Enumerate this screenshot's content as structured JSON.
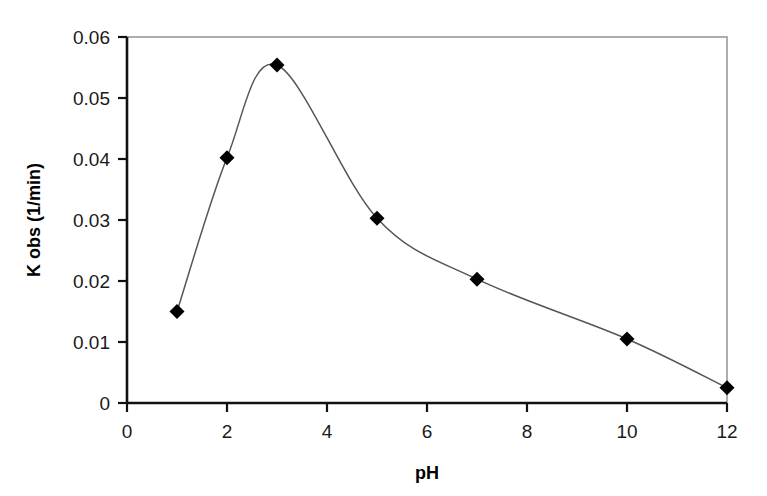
{
  "chart_data": {
    "type": "line",
    "title": "",
    "subtitle": "",
    "xlabel": "pH",
    "ylabel": "K obs (1/min)",
    "xlim": [
      0,
      12
    ],
    "ylim": [
      0,
      0.06
    ],
    "grid": false,
    "legend": null,
    "marker": "filled-diamond",
    "line_color": "#555555",
    "marker_color": "#000000",
    "frame_color": "#999999",
    "axis_color": "#000000",
    "x": [
      1,
      2,
      3,
      5,
      7,
      10,
      12
    ],
    "values": [
      0.015,
      0.0402,
      0.0554,
      0.0303,
      0.0203,
      0.0105,
      0.0025
    ],
    "series": [
      {
        "name": "K obs",
        "x": [
          1,
          2,
          3,
          5,
          7,
          10,
          12
        ],
        "values": [
          0.015,
          0.0402,
          0.0554,
          0.0303,
          0.0203,
          0.0105,
          0.0025
        ]
      }
    ],
    "x_ticks": [
      0,
      2,
      4,
      6,
      8,
      10,
      12
    ],
    "x_tick_labels": [
      "0",
      "2",
      "4",
      "6",
      "8",
      "10",
      "12"
    ],
    "y_ticks": [
      0,
      0.01,
      0.02,
      0.03,
      0.04,
      0.05,
      0.06
    ],
    "y_tick_labels": [
      "0",
      "0.01",
      "0.02",
      "0.03",
      "0.04",
      "0.05",
      "0.06"
    ],
    "annotations": []
  },
  "axes": {
    "x_title": "pH",
    "y_title": "K obs (1/min)"
  },
  "ticks": {
    "x": [
      "0",
      "2",
      "4",
      "6",
      "8",
      "10",
      "12"
    ],
    "y": [
      "0",
      "0.01",
      "0.02",
      "0.03",
      "0.04",
      "0.05",
      "0.06"
    ]
  }
}
